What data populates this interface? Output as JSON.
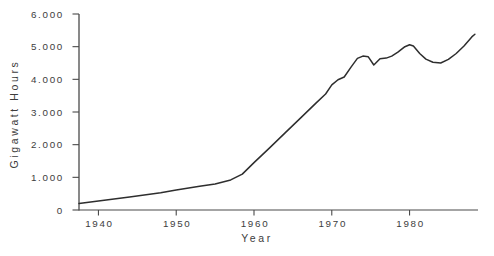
{
  "chart_data": {
    "type": "line",
    "title": "",
    "xlabel": "Year",
    "ylabel": "Gigawatt Hours",
    "xlim": [
      1937.5,
      1988.8
    ],
    "ylim": [
      0,
      6000
    ],
    "grid": false,
    "legend": "none",
    "colors": {
      "background": "#ffffff",
      "line": "#2e2e2e",
      "axis": "#4a4a4a",
      "text": "#3d3d3d"
    },
    "y_ticks": [
      {
        "label": "0",
        "value": 0
      },
      {
        "label": "1.000",
        "value": 1000
      },
      {
        "label": "2.000",
        "value": 2000
      },
      {
        "label": "3.000",
        "value": 3000
      },
      {
        "label": "4.000",
        "value": 4000
      },
      {
        "label": "5.000",
        "value": 5000
      },
      {
        "label": "6.000",
        "value": 6000
      }
    ],
    "x_ticks": [
      {
        "label": "1940",
        "value": 1940
      },
      {
        "label": "1950",
        "value": 1950
      },
      {
        "label": "1960",
        "value": 1960
      },
      {
        "label": "1970",
        "value": 1970
      },
      {
        "label": "1980",
        "value": 1980
      }
    ],
    "series": [
      {
        "name": "gigawatt-hours",
        "points": [
          [
            1937.5,
            200
          ],
          [
            1940,
            280
          ],
          [
            1944,
            400
          ],
          [
            1948,
            530
          ],
          [
            1950,
            610
          ],
          [
            1953,
            730
          ],
          [
            1955,
            800
          ],
          [
            1957,
            920
          ],
          [
            1958.5,
            1100
          ],
          [
            1960,
            1450
          ],
          [
            1962,
            1900
          ],
          [
            1964,
            2360
          ],
          [
            1966,
            2820
          ],
          [
            1968,
            3280
          ],
          [
            1969.2,
            3550
          ],
          [
            1970,
            3830
          ],
          [
            1970.8,
            3990
          ],
          [
            1971.6,
            4070
          ],
          [
            1972.5,
            4380
          ],
          [
            1973.3,
            4640
          ],
          [
            1974,
            4710
          ],
          [
            1974.7,
            4690
          ],
          [
            1975.4,
            4440
          ],
          [
            1976.2,
            4630
          ],
          [
            1977,
            4650
          ],
          [
            1977.7,
            4710
          ],
          [
            1978.5,
            4830
          ],
          [
            1979.4,
            5000
          ],
          [
            1980,
            5060
          ],
          [
            1980.5,
            5020
          ],
          [
            1981.3,
            4790
          ],
          [
            1982.1,
            4620
          ],
          [
            1983,
            4520
          ],
          [
            1984,
            4500
          ],
          [
            1985,
            4610
          ],
          [
            1986,
            4790
          ],
          [
            1987,
            5020
          ],
          [
            1988,
            5300
          ],
          [
            1988.4,
            5380
          ]
        ]
      }
    ]
  }
}
